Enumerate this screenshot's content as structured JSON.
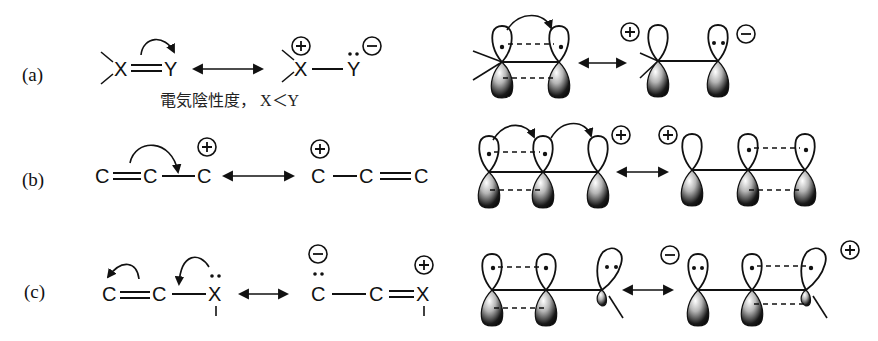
{
  "figure": {
    "rows": [
      {
        "id": "a",
        "label": "(a)",
        "left_structure": {
          "atom1": "X",
          "atom2": "Y",
          "bond": "double"
        },
        "right_structure": {
          "atom1": "X",
          "atom2": "Y",
          "bond": "single",
          "charge1": "+",
          "charge2": "−",
          "lone_pair_on": "Y"
        },
        "note": "電気陰性度， X＜Y",
        "orbital_charges": {
          "left": "+",
          "right": "−"
        }
      },
      {
        "id": "b",
        "label": "(b)",
        "left_structure": {
          "atoms": [
            "C",
            "C",
            "C"
          ],
          "bonds": [
            "double",
            "single"
          ],
          "charge_on": 3,
          "charge": "+"
        },
        "right_structure": {
          "atoms": [
            "C",
            "C",
            "C"
          ],
          "bonds": [
            "single",
            "double"
          ],
          "charge_on": 1,
          "charge": "+"
        },
        "orbital_charges": {
          "first": "+",
          "second": "+"
        }
      },
      {
        "id": "c",
        "label": "(c)",
        "left_structure": {
          "atoms": [
            "C",
            "C",
            "X"
          ],
          "bonds": [
            "double",
            "single"
          ],
          "lone_pair_on": 3
        },
        "right_structure": {
          "atoms": [
            "C",
            "C",
            "X"
          ],
          "bonds": [
            "single",
            "double"
          ],
          "lone_pair_on": 1,
          "charge1": "−",
          "charge3": "+"
        },
        "orbital_charges": {
          "first": "−",
          "second": "+"
        }
      }
    ],
    "resonance_arrow": "↔",
    "colors": {
      "ink": "#111111",
      "background": "#ffffff",
      "lobe_shade_dark": "#111111",
      "lobe_shade_light": "#ffffff"
    }
  }
}
